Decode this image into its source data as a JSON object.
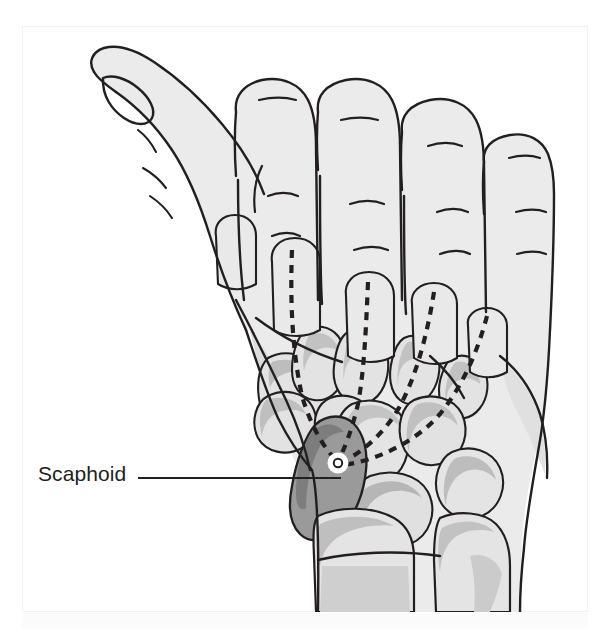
{
  "figure": {
    "view": "dorsal oblique view of right hand with carpal bones visible through soft tissue"
  },
  "callout": {
    "label": "Scaphoid",
    "leader_line": {
      "x1": 138,
      "y1": 478,
      "x2": 341,
      "y2": 478
    },
    "marker": {
      "name": "scaphoid-marker",
      "cx": 338,
      "cy": 463,
      "r": 9,
      "fill": "#ffffff",
      "stroke": "#231f20"
    }
  },
  "colors": {
    "soft_tissue": "#ebebeb",
    "soft_tissue_shadow": "#d8d8d8",
    "bone_fill": "#e3e3e3",
    "bone_shadow": "#b9b9b9",
    "scaphoid_fill": "#9a9a9a",
    "scaphoid_shadow": "#7d7d7d",
    "outline": "#231f20",
    "dashed_axis": "#231f20",
    "frame_border": "#f2f2f3",
    "background": "#ffffff",
    "label_text": "#231f20"
  },
  "anatomy": {
    "digits": [
      {
        "name": "thumb",
        "label": "Thumb (1st digit)",
        "nail": true
      },
      {
        "name": "index-finger",
        "label": "Index finger (2nd digit)",
        "nail": false
      },
      {
        "name": "middle-finger",
        "label": "Middle finger (3rd digit)",
        "nail": false
      },
      {
        "name": "ring-finger",
        "label": "Ring finger (4th digit)",
        "nail": false
      },
      {
        "name": "little-finger",
        "label": "Little finger (5th digit)",
        "nail": false
      }
    ],
    "bones": [
      {
        "name": "scaphoid",
        "highlighted": true
      },
      {
        "name": "trapezium",
        "highlighted": false
      },
      {
        "name": "trapezoid",
        "highlighted": false
      },
      {
        "name": "capitate",
        "highlighted": false
      },
      {
        "name": "hamate",
        "highlighted": false
      },
      {
        "name": "lunate",
        "highlighted": false
      },
      {
        "name": "radius",
        "highlighted": false
      },
      {
        "name": "ulna",
        "highlighted": false
      },
      {
        "name": "metacarpals",
        "highlighted": false
      },
      {
        "name": "proximal-phalanges",
        "highlighted": false
      }
    ],
    "axis_lines": {
      "name": "metacarpal-axis-lines",
      "count": 4,
      "style": "dashed",
      "description": "Dashed long axes of the metacarpals converging toward the scaphoid"
    }
  }
}
